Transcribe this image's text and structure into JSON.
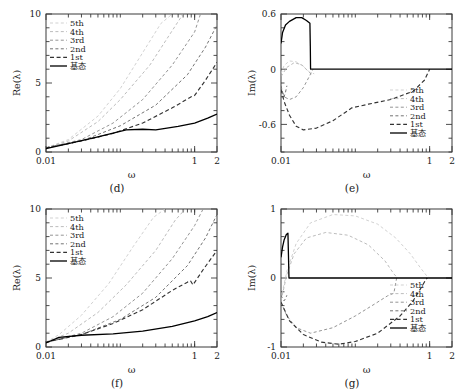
{
  "figure": {
    "panels": [
      {
        "id": "d",
        "caption": "(d)",
        "xlabel": "ω",
        "ylabel": "Re(λ)",
        "legend_position": "top-left"
      },
      {
        "id": "e",
        "caption": "(e)",
        "xlabel": "ω",
        "ylabel": "Im(λ)",
        "legend_position": "bottom-right"
      },
      {
        "id": "f",
        "caption": "(f)",
        "xlabel": "ω",
        "ylabel": "Re(λ)",
        "legend_position": "top-left"
      },
      {
        "id": "g",
        "caption": "(g)",
        "xlabel": "ω",
        "ylabel": "Im(λ)",
        "legend_position": "bottom-right"
      }
    ],
    "legend_entries": [
      "5th",
      "4th",
      "3rd",
      "2nd",
      "1st",
      "基态"
    ],
    "series_colors": [
      "#c9c9c9",
      "#b0b0b0",
      "#8e8e8e",
      "#6b6b6b",
      "#333333",
      "#000000"
    ],
    "series_dash": [
      "3,2.4",
      "3,2.4",
      "3,2.4",
      "3,2.4",
      "4,2.6",
      "none"
    ]
  },
  "chart_data": [
    {
      "type": "line",
      "id": "d",
      "title": "(d)",
      "xlabel": "ω",
      "ylabel": "Re(λ)",
      "xscale": "log",
      "xlim": [
        0.01,
        2
      ],
      "ylim": [
        0,
        10
      ],
      "xticks": [
        0.01,
        1,
        2
      ],
      "xticklabels": [
        "0.01",
        "1",
        "2"
      ],
      "yticks": [
        0,
        5,
        10
      ],
      "yticklabels": [
        "0",
        "5",
        "10"
      ],
      "grid": false,
      "legend": [
        "5th",
        "4th",
        "3rd",
        "2nd",
        "1st",
        "基态"
      ],
      "series": [
        {
          "name": "5th",
          "x": [
            0.01,
            0.02,
            0.05,
            0.1,
            0.2,
            0.35,
            0.5
          ],
          "y": [
            0.3,
            0.9,
            2.6,
            4.6,
            7.2,
            9.3,
            10.0
          ]
        },
        {
          "name": "4th",
          "x": [
            0.01,
            0.02,
            0.05,
            0.1,
            0.25,
            0.5,
            0.7
          ],
          "y": [
            0.3,
            0.8,
            2.2,
            3.8,
            6.3,
            8.8,
            10.0
          ]
        },
        {
          "name": "3rd",
          "x": [
            0.01,
            0.03,
            0.08,
            0.2,
            0.5,
            1.0,
            1.2
          ],
          "y": [
            0.3,
            0.9,
            2.1,
            3.8,
            6.3,
            8.7,
            10.0
          ]
        },
        {
          "name": "2nd",
          "x": [
            0.01,
            0.03,
            0.1,
            0.3,
            0.8,
            1.4,
            2.0
          ],
          "y": [
            0.3,
            0.8,
            1.9,
            3.4,
            5.6,
            7.6,
            9.2
          ]
        },
        {
          "name": "1st",
          "x": [
            0.01,
            0.03,
            0.08,
            0.2,
            0.5,
            0.9,
            1.0,
            1.4,
            2.0
          ],
          "y": [
            0.3,
            0.8,
            1.35,
            2.1,
            3.2,
            4.0,
            4.1,
            5.2,
            6.5
          ]
        },
        {
          "name": "基态",
          "x": [
            0.01,
            0.02,
            0.05,
            0.12,
            0.2,
            0.3,
            0.6,
            1.0,
            1.5,
            2.0
          ],
          "y": [
            0.25,
            0.6,
            1.1,
            1.6,
            1.65,
            1.6,
            1.85,
            2.1,
            2.45,
            2.75
          ]
        }
      ]
    },
    {
      "type": "line",
      "id": "e",
      "title": "(e)",
      "xlabel": "ω",
      "ylabel": "Im(λ)",
      "xscale": "log",
      "xlim": [
        0.01,
        2
      ],
      "ylim": [
        -0.9,
        0.6
      ],
      "xticks": [
        0.01,
        1,
        2
      ],
      "xticklabels": [
        "0.01",
        "1",
        "2"
      ],
      "yticks": [
        -0.6,
        0,
        0.6
      ],
      "yticklabels": [
        "-0.6",
        "0",
        "0.6"
      ],
      "grid": false,
      "legend": [
        "5th",
        "4th",
        "3rd",
        "2nd",
        "1st",
        "基态"
      ],
      "series": [
        {
          "name": "5th",
          "x": [
            0.01,
            0.011,
            0.013,
            0.016,
            0.02,
            0.024,
            0.028
          ],
          "y": [
            -0.05,
            0.04,
            0.09,
            0.08,
            0.03,
            -0.03,
            -0.05
          ]
        },
        {
          "name": "4th",
          "x": [
            0.01,
            0.012,
            0.015,
            0.019,
            0.023,
            0.026
          ],
          "y": [
            -0.08,
            0.02,
            0.07,
            0.05,
            -0.02,
            -0.06
          ]
        },
        {
          "name": "3rd",
          "x": [
            0.01,
            0.011,
            0.013,
            0.016,
            0.02,
            0.024,
            0.027
          ],
          "y": [
            -0.2,
            -0.3,
            -0.33,
            -0.3,
            -0.2,
            -0.08,
            0.0
          ]
        },
        {
          "name": "2nd",
          "x": [
            0.01,
            0.0105,
            0.011,
            0.0115,
            0.012
          ],
          "y": [
            -0.18,
            -0.25,
            -0.3,
            -0.25,
            -0.18
          ]
        },
        {
          "name": "1st",
          "x": [
            0.01,
            0.011,
            0.013,
            0.016,
            0.02,
            0.03,
            0.05,
            0.09,
            0.15,
            0.3,
            0.6,
            0.85,
            0.95,
            1.0
          ],
          "y": [
            -0.22,
            -0.35,
            -0.5,
            -0.62,
            -0.66,
            -0.64,
            -0.56,
            -0.42,
            -0.38,
            -0.33,
            -0.24,
            -0.12,
            -0.04,
            0.0
          ]
        },
        {
          "name": "基态",
          "x": [
            0.01,
            0.0105,
            0.0115,
            0.013,
            0.016,
            0.019,
            0.022,
            0.0245,
            0.0248,
            0.025,
            1.0,
            2.0
          ],
          "y": [
            0.28,
            0.4,
            0.48,
            0.52,
            0.56,
            0.56,
            0.53,
            0.5,
            0.25,
            0.0,
            0.0,
            0.0
          ]
        }
      ]
    },
    {
      "type": "line",
      "id": "f",
      "title": "(f)",
      "xlabel": "ω",
      "ylabel": "Re(λ)",
      "xscale": "log",
      "xlim": [
        0.01,
        2
      ],
      "ylim": [
        0,
        10
      ],
      "xticks": [
        0.01,
        1,
        2
      ],
      "xticklabels": [
        "0.01",
        "1",
        "2"
      ],
      "yticks": [
        0,
        5,
        10
      ],
      "yticklabels": [
        "0",
        "5",
        "10"
      ],
      "grid": false,
      "legend": [
        "5th",
        "4th",
        "3rd",
        "2nd",
        "1st",
        "基态"
      ],
      "series": [
        {
          "name": "5th",
          "x": [
            0.01,
            0.015,
            0.03,
            0.07,
            0.15,
            0.28,
            0.4
          ],
          "y": [
            0.35,
            0.9,
            2.3,
            4.6,
            7.3,
            9.4,
            10.0
          ]
        },
        {
          "name": "4th",
          "x": [
            0.01,
            0.02,
            0.05,
            0.12,
            0.3,
            0.55,
            0.75
          ],
          "y": [
            0.35,
            1.0,
            2.5,
            4.5,
            7.0,
            9.2,
            10.0
          ]
        },
        {
          "name": "3rd",
          "x": [
            0.01,
            0.03,
            0.08,
            0.2,
            0.5,
            1.0,
            1.3
          ],
          "y": [
            0.35,
            1.0,
            2.2,
            3.9,
            6.4,
            8.8,
            10.0
          ]
        },
        {
          "name": "2nd",
          "x": [
            0.01,
            0.03,
            0.1,
            0.3,
            0.8,
            1.4,
            2.0
          ],
          "y": [
            0.35,
            0.9,
            2.0,
            3.6,
            5.9,
            7.9,
            9.6
          ]
        },
        {
          "name": "1st",
          "x": [
            0.01,
            0.03,
            0.08,
            0.2,
            0.5,
            0.8,
            0.88,
            0.95,
            1.3,
            2.0
          ],
          "y": [
            0.35,
            0.9,
            1.7,
            2.7,
            4.1,
            4.7,
            4.8,
            4.5,
            5.6,
            7.0
          ]
        },
        {
          "name": "基态",
          "x": [
            0.01,
            0.015,
            0.03,
            0.08,
            0.2,
            0.5,
            1.0,
            1.5,
            2.0
          ],
          "y": [
            0.3,
            0.7,
            0.85,
            0.95,
            1.15,
            1.5,
            1.9,
            2.2,
            2.5
          ]
        }
      ]
    },
    {
      "type": "line",
      "id": "g",
      "title": "(g)",
      "xlabel": "ω",
      "ylabel": "Im(λ)",
      "xscale": "log",
      "xlim": [
        0.01,
        2
      ],
      "ylim": [
        -1,
        1
      ],
      "xticks": [
        0.01,
        1,
        2
      ],
      "xticklabels": [
        "0.01",
        "1",
        "2"
      ],
      "yticks": [
        -1,
        0,
        1
      ],
      "yticklabels": [
        "-1",
        "0",
        "1"
      ],
      "grid": false,
      "legend": [
        "5th",
        "4th",
        "3rd",
        "2nd",
        "1st",
        "基态"
      ],
      "series": [
        {
          "name": "5th",
          "x": [
            0.01,
            0.012,
            0.016,
            0.025,
            0.05,
            0.1,
            0.2,
            0.35,
            0.55,
            0.75,
            0.9,
            1.0
          ],
          "y": [
            -0.3,
            0.1,
            0.5,
            0.8,
            0.92,
            0.9,
            0.78,
            0.58,
            0.35,
            0.15,
            0.04,
            0.0
          ]
        },
        {
          "name": "4th",
          "x": [
            0.01,
            0.012,
            0.015,
            0.022,
            0.04,
            0.08,
            0.15,
            0.25,
            0.33,
            0.37
          ],
          "y": [
            -0.33,
            0.05,
            0.35,
            0.58,
            0.66,
            0.62,
            0.48,
            0.25,
            0.06,
            0.0
          ]
        },
        {
          "name": "3rd",
          "x": [
            0.01,
            0.012,
            0.016,
            0.025,
            0.05,
            0.1,
            0.18,
            0.27,
            0.33,
            0.36
          ],
          "y": [
            -0.35,
            -0.55,
            -0.72,
            -0.8,
            -0.72,
            -0.55,
            -0.38,
            -0.26,
            -0.22,
            0.0
          ]
        },
        {
          "name": "2nd",
          "x": [
            0.01,
            0.0105,
            0.011,
            0.0115,
            0.012
          ],
          "y": [
            -0.25,
            -0.3,
            -0.33,
            -0.3,
            -0.25
          ]
        },
        {
          "name": "1st",
          "x": [
            0.01,
            0.013,
            0.02,
            0.035,
            0.06,
            0.1,
            0.2,
            0.4,
            0.6,
            0.78,
            0.88,
            0.93
          ],
          "y": [
            -0.35,
            -0.62,
            -0.82,
            -0.93,
            -0.96,
            -0.92,
            -0.8,
            -0.55,
            -0.33,
            -0.13,
            -0.03,
            0.0
          ]
        },
        {
          "name": "基态",
          "x": [
            0.01,
            0.0105,
            0.011,
            0.0118,
            0.0124,
            0.0126,
            0.0128,
            1.0,
            2.0
          ],
          "y": [
            0.3,
            0.45,
            0.55,
            0.63,
            0.65,
            0.33,
            0.0,
            0.0,
            0.0
          ]
        }
      ]
    }
  ]
}
